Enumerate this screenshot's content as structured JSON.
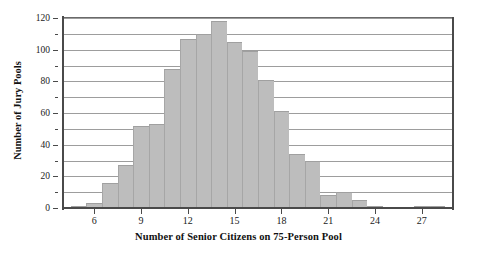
{
  "chart_data": {
    "type": "bar",
    "title": "",
    "subtitle": "",
    "xlabel": "Number of Senior Citizens on 75-Person Pool",
    "ylabel": "Number of Jury Pools",
    "xlim": [
      4,
      29
    ],
    "ylim": [
      0,
      120
    ],
    "grid": true,
    "legend": null,
    "bar_color": "#bdbdbd",
    "bar_edge_color": "#a0a0a0",
    "axis_color": "#4a4a4a",
    "gridline_color": "#9d9d9d",
    "bar_width": 1,
    "x_tick_labels": [
      "6",
      "9",
      "12",
      "15",
      "18",
      "21",
      "24",
      "27"
    ],
    "x_tick_values": [
      6,
      9,
      12,
      15,
      18,
      21,
      24,
      27
    ],
    "y_tick_labels": [
      "0",
      "20",
      "40",
      "60",
      "80",
      "100",
      "120"
    ],
    "y_tick_values": [
      0,
      20,
      40,
      60,
      80,
      100,
      120
    ],
    "y_minor_tick_values": [
      10,
      30,
      50,
      70,
      90,
      110
    ],
    "gridline_values": [
      10,
      20,
      30,
      40,
      50,
      60,
      70,
      80,
      90,
      100,
      110,
      120
    ],
    "categories": [
      5,
      6,
      7,
      8,
      9,
      10,
      11,
      12,
      13,
      14,
      15,
      16,
      17,
      18,
      19,
      20,
      21,
      22,
      23,
      24,
      25,
      26,
      27,
      28
    ],
    "values": [
      1,
      3,
      16,
      27,
      52,
      53,
      88,
      107,
      110,
      118,
      105,
      99,
      81,
      61,
      34,
      30,
      8,
      10,
      5,
      1,
      0,
      0,
      1,
      1
    ]
  }
}
